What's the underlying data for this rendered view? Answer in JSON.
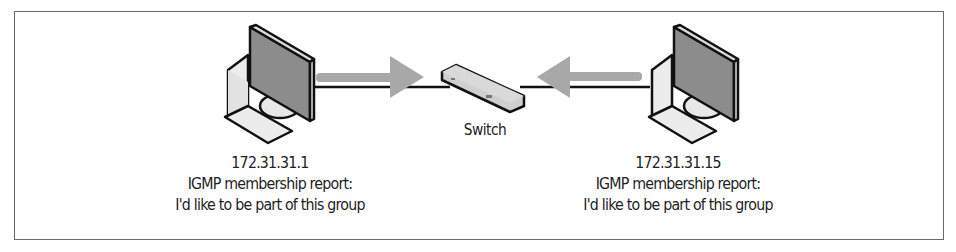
{
  "diagram": {
    "type": "network",
    "title": "IGMP membership report",
    "nodes": [
      {
        "id": "host-left",
        "kind": "computer",
        "ip": "172.31.31.1",
        "line2": "IGMP membership report:",
        "line3": "I'd like to be part of this group"
      },
      {
        "id": "switch",
        "kind": "switch",
        "label": "Switch"
      },
      {
        "id": "host-right",
        "kind": "computer",
        "ip": "172.31.31.15",
        "line2": "IGMP membership report:",
        "line3": "I'd like to be part of this group"
      }
    ],
    "edges": [
      {
        "from": "host-left",
        "to": "switch",
        "arrow": "toward-switch"
      },
      {
        "from": "host-right",
        "to": "switch",
        "arrow": "toward-switch"
      }
    ],
    "colors": {
      "border": "#6a6a6a",
      "outline": "#111111",
      "monitor_screen": "#8a8a8a",
      "device_body": "#e6e6e6",
      "arrow": "#a8a8a8",
      "text": "#222222"
    }
  }
}
